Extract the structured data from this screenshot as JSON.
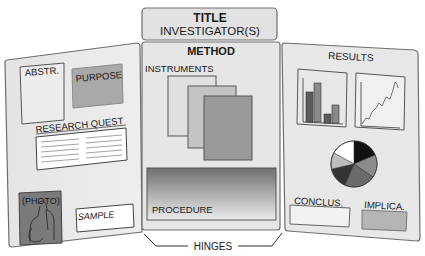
{
  "header": {
    "title": "TITLE",
    "subtitle": "INVESTIGATOR(S)"
  },
  "left_panel": {
    "abstract_label": "ABSTR.",
    "purpose_label": "PURPOSE",
    "research_question_label": "RESEARCH QUEST",
    "photo_label": "(PHOTO)",
    "sample_label": "SAMPLE"
  },
  "center_panel": {
    "heading": "METHOD",
    "instruments_label": "INSTRUMENTS",
    "procedure_label": "PROCEDURE"
  },
  "right_panel": {
    "heading": "RESULTS",
    "conclusion_label": "CONCLUS.",
    "implications_label": "IMPLICA."
  },
  "footer": {
    "hinges_label": "HINGES"
  },
  "colors": {
    "panel_fill": "#e9e9e9",
    "panel_stroke": "#6e6e6e",
    "header_fill": "#e2e2e2",
    "purpose_fill": "#a9a9a9",
    "photo_fill": "#7a7a7a",
    "implications_fill": "#b5b5b5"
  }
}
